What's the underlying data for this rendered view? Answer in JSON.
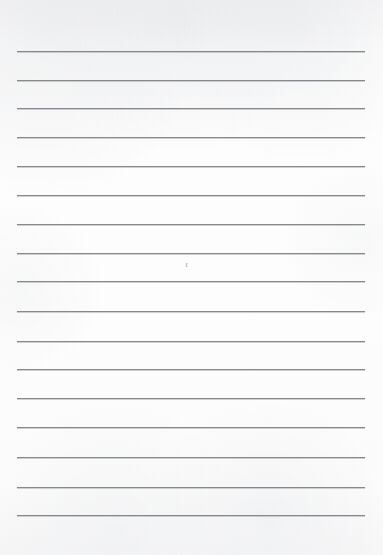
{
  "document": {
    "kind": "lined-paper-page",
    "title": "Blank ruled notebook page",
    "page_width": 383,
    "page_height": 555,
    "paper_color": "#fdfdfd",
    "background_color": "#ffffff"
  },
  "ruling": {
    "line_color": "#86888c",
    "line_thickness_px": 1,
    "line_count": 17,
    "left_margin_px": 17,
    "right_edge_px": 365,
    "line_length_px": 348,
    "first_line_y_px": 51,
    "spacing_px": 29,
    "top_blank_space_px": 51,
    "bottom_blank_space_px": 40,
    "lines_y": [
      51,
      80,
      108,
      137,
      166,
      195,
      224,
      253,
      281,
      311,
      341,
      369,
      398,
      427,
      457,
      487,
      515
    ]
  },
  "written_content": {
    "has_text": false,
    "text_lines": [
      "",
      "",
      "",
      "",
      "",
      "",
      "",
      "",
      "",
      "",
      "",
      "",
      "",
      "",
      "",
      "",
      ""
    ]
  },
  "marks": [
    {
      "name": "faint-pencil-mark",
      "glyph": "ℓ",
      "x_px": 185,
      "y_px": 262,
      "color": "#6b6d72",
      "description": "tiny faint pencil mark between lines 8 and 9"
    }
  ]
}
